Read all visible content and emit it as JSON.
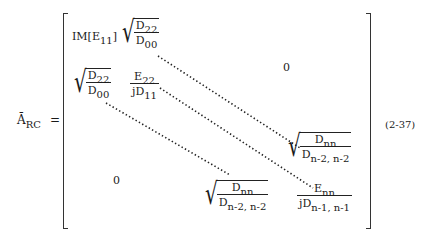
{
  "lhs": {
    "symbol": "Ā",
    "subscript": "RC",
    "equals": "="
  },
  "matrix": {
    "r1c1": {
      "prefix": "IM[",
      "base": "E",
      "sub": "11",
      "suffix": "]"
    },
    "r1c2": {
      "num_base": "D",
      "num_sub": "22",
      "den_base": "D",
      "den_sub": "00"
    },
    "upper_zero": "0",
    "r2c1": {
      "num_base": "D",
      "num_sub": "22",
      "den_base": "D",
      "den_sub": "00"
    },
    "r2c2": {
      "num_base": "E",
      "num_sub": "22",
      "den_base": "jD",
      "den_sub": "11"
    },
    "lower_zero": "0",
    "rn1cn": {
      "num_base": "D",
      "num_sub": "nn",
      "den_base": "D",
      "den_sub": "n-2, n-2"
    },
    "rncn1": {
      "num_base": "D",
      "num_sub": "nn",
      "den_base": "D",
      "den_sub": "n-2, n-2"
    },
    "rncn": {
      "num_base": "E",
      "num_sub": "nn",
      "den_base": "jD",
      "den_sub": "n-1, n-1"
    }
  },
  "equation_number": "(2-37)"
}
